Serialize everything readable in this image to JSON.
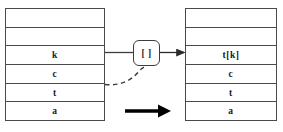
{
  "diagram": {
    "colors": {
      "border": "#4a4a4a",
      "text": "#1a1a1a",
      "arrow": "#000000",
      "background": "#ffffff"
    },
    "left_stack": {
      "name": "input-stack",
      "cells": [
        {
          "label": "",
          "empty": true
        },
        {
          "label": "",
          "empty": true
        },
        {
          "label": "k",
          "empty": false
        },
        {
          "label": "c",
          "empty": false
        },
        {
          "label": "t",
          "empty": false
        },
        {
          "label": "a",
          "empty": false
        }
      ]
    },
    "operator": {
      "label": "[ ]",
      "name": "index-operator"
    },
    "right_stack": {
      "name": "output-stack",
      "cells": [
        {
          "label": "",
          "empty": true
        },
        {
          "label": "",
          "empty": true
        },
        {
          "label": "t[k]",
          "empty": false
        },
        {
          "label": "c",
          "empty": false
        },
        {
          "label": "t",
          "empty": false
        },
        {
          "label": "a",
          "empty": false
        }
      ]
    },
    "connectors": {
      "input_line": "solid-line-k-to-operator",
      "output_arrow": "arrow-operator-to-result",
      "dashed_curve": "dashed-curve-t-to-operator",
      "transform_arrow": "bold-transform-arrow"
    }
  }
}
